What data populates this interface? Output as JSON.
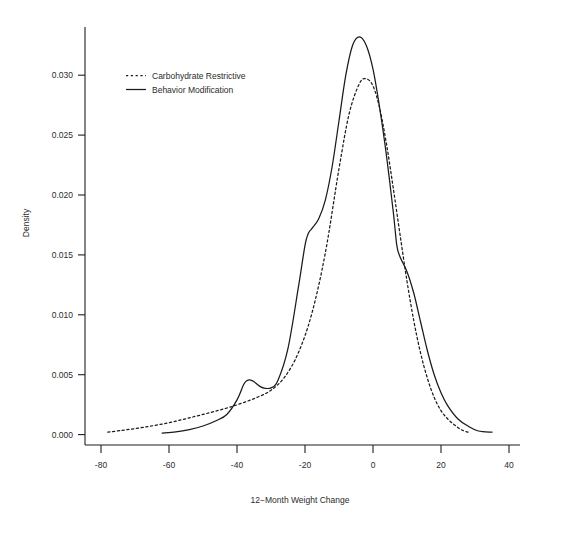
{
  "chart_data": {
    "type": "line",
    "title": "",
    "xlabel": "12−Month Weight Change",
    "ylabel": "Density",
    "xlim": [
      -92,
      52
    ],
    "ylim": [
      -0.0008,
      0.0345
    ],
    "xticks": [
      -80,
      -60,
      -40,
      -20,
      0,
      20,
      40
    ],
    "xticklabels": [
      "-80",
      "-60",
      "-40",
      "-20",
      "0",
      "20",
      "40"
    ],
    "yticks": [
      0.0,
      0.005,
      0.01,
      0.015,
      0.02,
      0.025,
      0.03
    ],
    "yticklabels": [
      "0.000",
      "0.005",
      "0.010",
      "0.015",
      "0.020",
      "0.025",
      "0.030"
    ],
    "grid": false,
    "legend_position": "upper-left-inside",
    "series": [
      {
        "name": "Carbohydrate Restrictive",
        "style": "dashed",
        "color": "#1a1a1a",
        "x": [
          -78,
          -74,
          -70,
          -66,
          -62,
          -58,
          -54,
          -50,
          -46,
          -42,
          -38,
          -34,
          -30,
          -26,
          -22,
          -18,
          -14,
          -10,
          -7,
          -4,
          -2,
          0,
          2,
          4,
          6,
          8,
          10,
          12,
          14,
          16,
          18,
          20,
          22,
          24,
          26,
          28
        ],
        "y": [
          0.0002,
          0.00035,
          0.0005,
          0.00068,
          0.00088,
          0.00112,
          0.0014,
          0.00168,
          0.00198,
          0.0023,
          0.00268,
          0.00312,
          0.0037,
          0.0048,
          0.0068,
          0.0101,
          0.0152,
          0.0222,
          0.0268,
          0.0293,
          0.0297,
          0.0291,
          0.0272,
          0.0242,
          0.0205,
          0.0166,
          0.0128,
          0.0095,
          0.0068,
          0.0047,
          0.0031,
          0.002,
          0.0013,
          0.0008,
          0.0004,
          0.0002
        ]
      },
      {
        "name": "Behavior Modification",
        "style": "solid",
        "color": "#1a1a1a",
        "x": [
          -62,
          -58,
          -54,
          -50,
          -46,
          -43,
          -40,
          -38,
          -37,
          -36,
          -35,
          -34,
          -33,
          -32,
          -30,
          -28,
          -25,
          -22,
          -20,
          -19,
          -18,
          -16,
          -14,
          -12,
          -10,
          -8,
          -6,
          -4,
          -2,
          0,
          2,
          4,
          6,
          7,
          8,
          10,
          12,
          14,
          16,
          18,
          20,
          22,
          25,
          28,
          31,
          35
        ],
        "y": [
          0.00012,
          0.00022,
          0.00042,
          0.00072,
          0.00118,
          0.00168,
          0.0029,
          0.0042,
          0.00452,
          0.00455,
          0.00442,
          0.00418,
          0.00398,
          0.00388,
          0.0039,
          0.0045,
          0.0072,
          0.0122,
          0.0158,
          0.0168,
          0.0172,
          0.018,
          0.0196,
          0.0224,
          0.0262,
          0.03,
          0.0325,
          0.0332,
          0.0325,
          0.0305,
          0.0272,
          0.0232,
          0.0185,
          0.0158,
          0.0148,
          0.0136,
          0.0118,
          0.0094,
          0.007,
          0.005,
          0.0035,
          0.0024,
          0.0013,
          0.0007,
          0.0003,
          0.0002
        ]
      }
    ]
  },
  "legend": {
    "items": [
      {
        "label": "Carbohydrate Restrictive",
        "style": "dashed"
      },
      {
        "label": "Behavior Modification",
        "style": "solid"
      }
    ]
  }
}
